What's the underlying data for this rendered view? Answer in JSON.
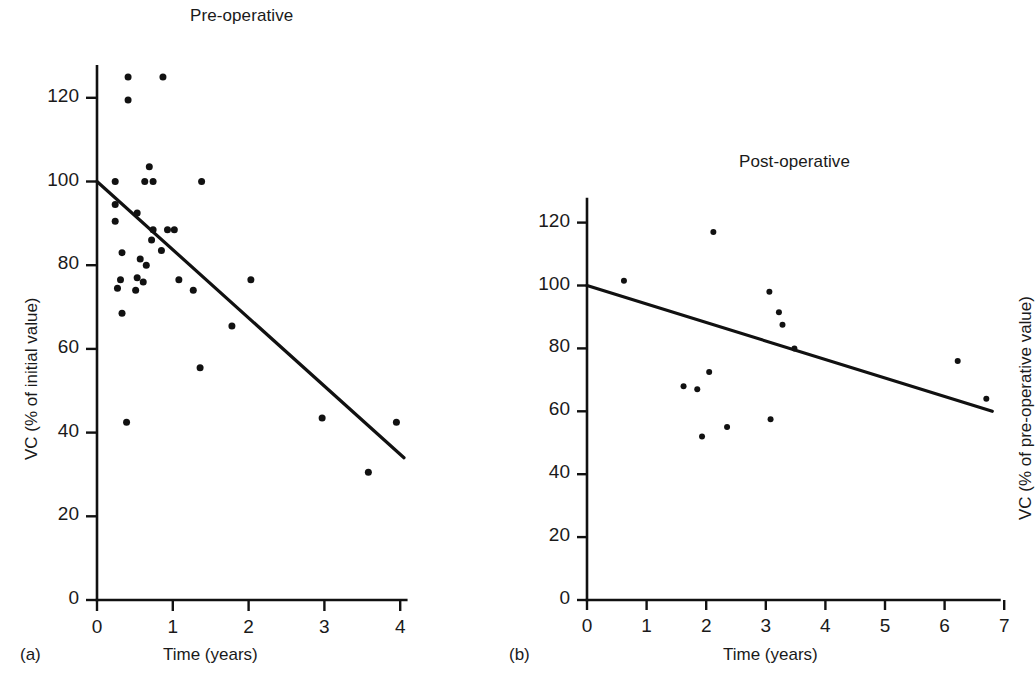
{
  "figure": {
    "panel_a": {
      "letter": "(a)",
      "title": "Pre-operative",
      "xlabel": "Time (years)",
      "ylabel": "VC (% of initial value)"
    },
    "panel_b": {
      "letter": "(b)",
      "title": "Post-operative",
      "xlabel": "Time (years)",
      "ylabel": "VC (% of pre-operative value)"
    },
    "ink_color": "#111111",
    "background_color": "#ffffff"
  },
  "chart_data": [
    {
      "type": "scatter",
      "panel": "(a)",
      "title": "Pre-operative",
      "xlabel": "Time (years)",
      "ylabel": "VC (% of initial value)",
      "xlim": [
        0,
        4.2
      ],
      "ylim": [
        0,
        128
      ],
      "xticks": [
        0,
        1,
        2,
        3,
        4
      ],
      "xticklabels": [
        "0",
        "1",
        "2",
        "3",
        "4"
      ],
      "yticks": [
        0,
        20,
        40,
        60,
        80,
        100,
        120
      ],
      "yticklabels": [
        "0",
        "20",
        "40",
        "60",
        "80",
        "100",
        "120"
      ],
      "grid": false,
      "legend": "none",
      "points": [
        {
          "x": 0.41,
          "y": 125.0
        },
        {
          "x": 0.87,
          "y": 125.0
        },
        {
          "x": 0.41,
          "y": 119.5
        },
        {
          "x": 0.69,
          "y": 103.5
        },
        {
          "x": 0.24,
          "y": 100.0
        },
        {
          "x": 0.63,
          "y": 100.0
        },
        {
          "x": 0.74,
          "y": 100.0
        },
        {
          "x": 1.38,
          "y": 100.0
        },
        {
          "x": 0.24,
          "y": 94.5
        },
        {
          "x": 0.53,
          "y": 92.5
        },
        {
          "x": 0.24,
          "y": 90.5
        },
        {
          "x": 0.74,
          "y": 88.5
        },
        {
          "x": 0.93,
          "y": 88.5
        },
        {
          "x": 1.02,
          "y": 88.5
        },
        {
          "x": 0.72,
          "y": 86.0
        },
        {
          "x": 0.85,
          "y": 83.5
        },
        {
          "x": 0.33,
          "y": 83.0
        },
        {
          "x": 0.57,
          "y": 81.5
        },
        {
          "x": 0.65,
          "y": 80.0
        },
        {
          "x": 0.31,
          "y": 76.5
        },
        {
          "x": 0.53,
          "y": 77.0
        },
        {
          "x": 0.61,
          "y": 76.0
        },
        {
          "x": 1.08,
          "y": 76.5
        },
        {
          "x": 0.27,
          "y": 74.5
        },
        {
          "x": 0.51,
          "y": 74.0
        },
        {
          "x": 1.27,
          "y": 74.0
        },
        {
          "x": 2.03,
          "y": 76.5
        },
        {
          "x": 0.33,
          "y": 68.5
        },
        {
          "x": 1.78,
          "y": 65.5
        },
        {
          "x": 1.36,
          "y": 55.5
        },
        {
          "x": 0.39,
          "y": 42.5
        },
        {
          "x": 2.97,
          "y": 43.5
        },
        {
          "x": 3.95,
          "y": 42.5
        },
        {
          "x": 3.58,
          "y": 30.5
        }
      ],
      "fit_line": {
        "x": [
          0,
          4.05
        ],
        "y": [
          100,
          34
        ]
      }
    },
    {
      "type": "scatter",
      "panel": "(b)",
      "title": "Post-operative",
      "xlabel": "Time (years)",
      "ylabel": "VC (% of pre-operative value)",
      "xlim": [
        0,
        6.9
      ],
      "ylim": [
        0,
        128
      ],
      "xticks": [
        0,
        1,
        2,
        3,
        4,
        5,
        6,
        7
      ],
      "xticklabels": [
        "0",
        "1",
        "2",
        "3",
        "4",
        "5",
        "6",
        "7"
      ],
      "yticks": [
        0,
        20,
        40,
        60,
        80,
        100,
        120
      ],
      "yticklabels": [
        "0",
        "20",
        "40",
        "60",
        "80",
        "100",
        "120"
      ],
      "grid": false,
      "legend": "none",
      "points": [
        {
          "x": 2.12,
          "y": 117.0
        },
        {
          "x": 0.62,
          "y": 101.5
        },
        {
          "x": 3.06,
          "y": 98.0
        },
        {
          "x": 3.22,
          "y": 91.5
        },
        {
          "x": 3.28,
          "y": 87.5
        },
        {
          "x": 3.48,
          "y": 80.0
        },
        {
          "x": 6.22,
          "y": 76.0
        },
        {
          "x": 2.05,
          "y": 72.5
        },
        {
          "x": 1.62,
          "y": 68.0
        },
        {
          "x": 1.85,
          "y": 67.0
        },
        {
          "x": 6.7,
          "y": 64.0
        },
        {
          "x": 3.08,
          "y": 57.5
        },
        {
          "x": 2.35,
          "y": 55.0
        },
        {
          "x": 1.93,
          "y": 52.0
        }
      ],
      "fit_line": {
        "x": [
          0,
          6.8
        ],
        "y": [
          100,
          60
        ]
      }
    }
  ]
}
